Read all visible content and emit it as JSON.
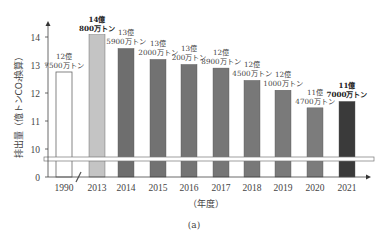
{
  "chart_data": {
    "type": "bar",
    "title": "",
    "xlabel": "（年度）",
    "ylabel": "排出量（億トンCO₂換算）",
    "caption": "(a)",
    "categories": [
      "1990",
      "2013",
      "2014",
      "2015",
      "2016",
      "2017",
      "2018",
      "2019",
      "2020",
      "2021"
    ],
    "values": [
      12.75,
      14.08,
      13.59,
      13.2,
      13.02,
      12.89,
      12.45,
      12.1,
      11.47,
      11.7
    ],
    "value_labels": [
      {
        "line1": "12億",
        "line2": "7500万トン",
        "bold": false
      },
      {
        "line1": "14億",
        "line2": "800万トン",
        "bold": true
      },
      {
        "line1": "13億",
        "line2": "5900万トン",
        "bold": false
      },
      {
        "line1": "13億",
        "line2": "2000万トン",
        "bold": false
      },
      {
        "line1": "13億",
        "line2": "200万トン",
        "bold": false
      },
      {
        "line1": "12億",
        "line2": "8900万トン",
        "bold": false
      },
      {
        "line1": "12億",
        "line2": "4500万トン",
        "bold": false
      },
      {
        "line1": "12億",
        "line2": "1000万トン",
        "bold": false
      },
      {
        "line1": "11億",
        "line2": "4700万トン",
        "bold": false
      },
      {
        "line1": "11億",
        "line2": "7000万トン",
        "bold": true
      }
    ],
    "bar_colors": [
      "#ffffff",
      "#c4c4c4",
      "#6e6e6e",
      "#727272",
      "#747474",
      "#767676",
      "#787878",
      "#7a7a7a",
      "#7c7c7c",
      "#3a3a3a"
    ],
    "yticks": [
      "0",
      "10",
      "11",
      "12",
      "13",
      "14"
    ],
    "ylim": [
      10,
      14.5
    ],
    "axis_break": true,
    "grid": false,
    "legend": null
  }
}
